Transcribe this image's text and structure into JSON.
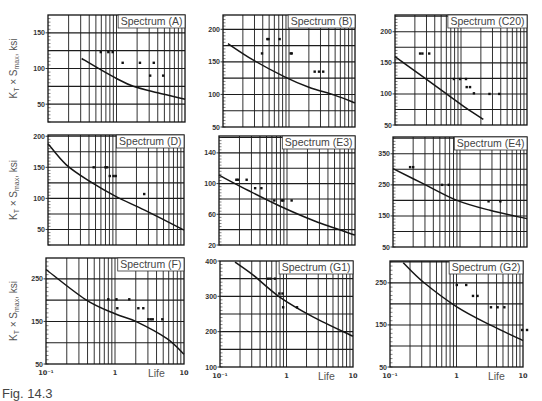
{
  "figure": {
    "caption": "Fig. 14.3"
  },
  "chart_data": [
    {
      "title": "Spectrum (A)",
      "type": "line",
      "xscale": "log",
      "xlim": [
        0.1,
        10
      ],
      "ylim": [
        25,
        175
      ],
      "ygrid_step": 25,
      "yticks": [
        50,
        100,
        150
      ],
      "grid": true,
      "title_placement": "top-right",
      "ylabel": "K_T × S_max, ksi",
      "ylabel_parts": {
        "k": "K",
        "k_sub": "T",
        "mid": " × S",
        "mid_sub": "max",
        "end": ", ksi"
      },
      "xlabel": "",
      "xticks": [],
      "xtick_labels": [],
      "series": [
        {
          "type": "line",
          "x": [
            0.31,
            0.57,
            1.0,
            1.76,
            4.0,
            10
          ],
          "y": [
            114,
            99,
            86,
            75,
            66,
            57
          ]
        },
        {
          "type": "scatter",
          "x": [
            0.59,
            0.76,
            0.88,
            1.23,
            2.2,
            3.5,
            3.1,
            4.8
          ],
          "y": [
            123,
            123,
            123,
            108,
            108,
            108,
            90,
            90
          ]
        }
      ]
    },
    {
      "title": "Spectrum (B)",
      "type": "line",
      "xscale": "log",
      "xlim": [
        0.1,
        10
      ],
      "ylim": [
        50,
        222
      ],
      "ygrid_step": 25,
      "yticks": [
        50,
        100,
        150,
        200
      ],
      "grid": true,
      "title_placement": "top-right",
      "xlabel": "",
      "xticks": [],
      "xtick_labels": [],
      "series": [
        {
          "type": "line",
          "x": [
            0.119,
            0.285,
            0.86,
            2.0,
            4.9,
            10
          ],
          "y": [
            178,
            153,
            127,
            111,
            99,
            87
          ]
        },
        {
          "type": "scatter",
          "x": [
            0.39,
            0.47,
            0.49,
            0.72,
            1.06,
            1.1,
            2.45,
            2.85,
            3.3
          ],
          "y": [
            163,
            185,
            185,
            185,
            163,
            163,
            135,
            135,
            135
          ]
        }
      ]
    },
    {
      "title": "Spectrum (C20)",
      "type": "line",
      "xscale": "log",
      "xlim": [
        0.1,
        10
      ],
      "ylim": [
        50,
        227
      ],
      "ygrid_step": 25,
      "yticks": [
        50,
        100,
        150,
        200
      ],
      "grid": true,
      "title_placement": "top-right",
      "xlabel": "",
      "xticks": [],
      "xtick_labels": [],
      "series": [
        {
          "type": "line",
          "x": [
            0.1,
            0.27,
            0.64,
            1.2,
            2.18
          ],
          "y": [
            160,
            127,
            98,
            77,
            59
          ]
        },
        {
          "type": "scatter",
          "x": [
            0.24,
            0.26,
            0.33,
            0.78,
            0.97,
            1.19,
            1.22,
            1.37,
            1.57,
            2.7,
            3.8
          ],
          "y": [
            165,
            165,
            165,
            124,
            124,
            124,
            111,
            111,
            101,
            100,
            100
          ]
        }
      ]
    },
    {
      "title": "Spectrum (D)",
      "type": "line",
      "xscale": "log",
      "xlim": [
        0.1,
        10
      ],
      "ylim": [
        25,
        202
      ],
      "ygrid_step": 25,
      "yticks": [
        50,
        100,
        150,
        200
      ],
      "grid": true,
      "title_placement": "top-right",
      "ylabel": "K_T × S_max, ksi",
      "ylabel_parts": {
        "k": "K",
        "k_sub": "T",
        "mid": " × S",
        "mid_sub": "max",
        "end": ", ksi"
      },
      "xlabel": "",
      "xticks": [],
      "xtick_labels": [],
      "series": [
        {
          "type": "line",
          "x": [
            0.1,
            0.186,
            0.43,
            0.96,
            2.64,
            10
          ],
          "y": [
            188,
            154,
            126,
            104,
            81,
            49
          ]
        },
        {
          "type": "scatter",
          "x": [
            0.47,
            0.7,
            0.74,
            0.81,
            0.92,
            0.99,
            2.6
          ],
          "y": [
            150,
            150,
            150,
            136,
            136,
            136,
            107
          ]
        }
      ]
    },
    {
      "title": "Spectrum (E3)",
      "type": "line",
      "xscale": "log",
      "xlim": [
        0.1,
        10
      ],
      "ylim": [
        20,
        162
      ],
      "ygrid_step": 20,
      "yticks": [
        20,
        60,
        100,
        140
      ],
      "grid": true,
      "title_placement": "top-right",
      "xlabel": "",
      "xticks": [],
      "xtick_labels": [],
      "series": [
        {
          "type": "line",
          "x": [
            0.1,
            0.27,
            0.84,
            2.6,
            10
          ],
          "y": [
            111,
            91,
            69.5,
            51,
            33
          ]
        },
        {
          "type": "scatter",
          "x": [
            0.18,
            0.19,
            0.255,
            0.34,
            0.42,
            0.65,
            0.84,
            0.88,
            1.17
          ],
          "y": [
            105,
            105,
            105,
            94,
            94,
            78,
            78,
            78,
            78
          ]
        }
      ]
    },
    {
      "title": "Spectrum (E4)",
      "type": "line",
      "xscale": "log",
      "xlim": [
        0.1,
        10
      ],
      "ylim": [
        50,
        404
      ],
      "ygrid_step": 50,
      "yticks": [
        50,
        150,
        250,
        350
      ],
      "grid": true,
      "title_placement": "top-right",
      "xlabel": "",
      "xticks": [],
      "xtick_labels": [],
      "series": [
        {
          "type": "line",
          "x": [
            0.1,
            0.286,
            0.9,
            2.8,
            10
          ],
          "y": [
            302,
            253,
            200,
            168,
            141
          ]
        },
        {
          "type": "scatter",
          "x": [
            0.18,
            0.2,
            0.54,
            0.68,
            2.67,
            4.0
          ],
          "y": [
            307,
            307,
            250,
            250,
            197,
            197
          ]
        }
      ]
    },
    {
      "title": "Spectrum (F)",
      "type": "line",
      "xscale": "log",
      "xlim": [
        0.1,
        10
      ],
      "ylim": [
        50,
        299
      ],
      "ygrid_step": 50,
      "yticks": [
        50,
        150,
        250
      ],
      "grid": true,
      "title_placement": "top-right",
      "ylabel": "K_T × S_max, ksi",
      "ylabel_parts": {
        "k": "K",
        "k_sub": "T",
        "mid": " × S",
        "mid_sub": "max",
        "end": ", ksi"
      },
      "xlabel": "Life",
      "xticks": [
        0.1,
        1,
        10
      ],
      "xtick_labels": [
        "10⁻¹",
        "1",
        "10"
      ],
      "series": [
        {
          "type": "line",
          "x": [
            0.1,
            0.37,
            1.0,
            2.0,
            5.6,
            10
          ],
          "y": [
            272,
            202,
            168,
            150,
            110,
            73
          ]
        },
        {
          "type": "scatter",
          "x": [
            0.8,
            1.05,
            1.61,
            1.08,
            2.18,
            2.57,
            3.04,
            3.29,
            3.52,
            4.85
          ],
          "y": [
            202,
            202,
            202,
            181,
            181,
            181,
            155,
            155,
            155,
            155
          ]
        }
      ]
    },
    {
      "title": "Spectrum (G1)",
      "type": "line",
      "xscale": "log",
      "xlim": [
        0.1,
        10
      ],
      "ylim": [
        100,
        400
      ],
      "ygrid_step": 50,
      "yticks": [
        100,
        200,
        300,
        400
      ],
      "grid": true,
      "title_placement": "top-right",
      "xlabel": "Life",
      "xticks": [
        0.1,
        1,
        10
      ],
      "xtick_labels": [
        "10⁻¹",
        "1",
        "10"
      ],
      "series": [
        {
          "type": "line",
          "x": [
            0.168,
            0.316,
            0.79,
            2.5,
            10
          ],
          "y": [
            397,
            360,
            298,
            242,
            187
          ]
        },
        {
          "type": "scatter",
          "x": [
            0.53,
            0.575,
            0.67,
            0.78,
            0.87,
            0.89,
            1.44
          ],
          "y": [
            350,
            350,
            350,
            308,
            308,
            269,
            269
          ]
        }
      ]
    },
    {
      "title": "Spectrum (G2)",
      "type": "line",
      "xscale": "log",
      "xlim": [
        0.1,
        10
      ],
      "ylim": [
        50,
        302
      ],
      "ygrid_step": 50,
      "yticks": [
        50,
        150,
        250
      ],
      "grid": true,
      "title_placement": "top-right",
      "xlabel": "Life",
      "xticks": [
        0.1,
        1,
        10
      ],
      "xtick_labels": [
        "10⁻¹",
        "1",
        "10"
      ],
      "series": [
        {
          "type": "line",
          "x": [
            0.158,
            0.316,
            1.01,
            3.2,
            10
          ],
          "y": [
            298,
            252,
            193,
            150,
            113
          ]
        },
        {
          "type": "scatter",
          "x": [
            1.01,
            1.4,
            1.77,
            2.07,
            3.3,
            4.15,
            5.24,
            9.7,
            11.5
          ],
          "y": [
            245,
            245,
            219,
            219,
            192,
            192,
            192,
            138,
            138
          ]
        }
      ]
    }
  ]
}
